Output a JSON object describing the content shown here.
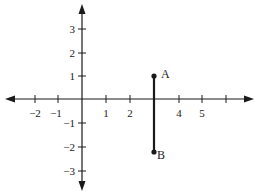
{
  "diagram": {
    "type": "coordinate-plane",
    "x_axis": {
      "tick_labels": [
        "−2",
        "−1",
        "1",
        "2",
        "4",
        "5"
      ],
      "tick_values": [
        -2,
        -1,
        1,
        2,
        4,
        5
      ],
      "unlabeled_ticks": [
        3,
        6
      ]
    },
    "y_axis": {
      "tick_labels": [
        "3",
        "2",
        "1",
        "−1",
        "−2",
        "−3"
      ],
      "tick_values": [
        3,
        2,
        1,
        -1,
        -2,
        -3
      ]
    },
    "points": [
      {
        "label": "A",
        "x": 3,
        "y": 1
      },
      {
        "label": "B",
        "x": 3,
        "y": -2.2
      }
    ],
    "segment": {
      "from": "A",
      "to": "B"
    },
    "colors": {
      "ink": "#1a1a1a",
      "background": "#ffffff"
    }
  }
}
